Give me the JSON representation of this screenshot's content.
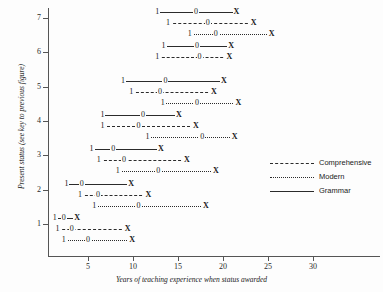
{
  "chart_data": {
    "type": "line",
    "title": "",
    "xlabel": "Years of teaching experience when status awarded",
    "ylabel": "Present status (see key to previous figure)",
    "xlim": [
      0,
      37
    ],
    "ylim": [
      0.4,
      7.6
    ],
    "xticks": [
      5,
      10,
      15,
      20,
      25,
      30
    ],
    "yticks": [
      1,
      2,
      3,
      4,
      5,
      6,
      7
    ],
    "grid": false,
    "legend_position": "right",
    "point_labels": [
      "1",
      "0",
      "X"
    ],
    "legend": [
      {
        "name": "Comprehensive",
        "style": "dashed"
      },
      {
        "name": "Modern",
        "style": "dotted"
      },
      {
        "name": "Grammar",
        "style": "solid"
      }
    ],
    "series": [
      {
        "status": 7,
        "rows": [
          {
            "school": "Grammar",
            "style": "grammar",
            "lower": 12.7,
            "median": 17.0,
            "upper": 21.4
          },
          {
            "school": "Comprehensive",
            "style": "comprehensive",
            "lower": 13.9,
            "median": 18.3,
            "upper": 23.3
          },
          {
            "school": "Modern",
            "style": "modern",
            "lower": 16.3,
            "median": 19.2,
            "upper": 25.3
          }
        ]
      },
      {
        "status": 6,
        "rows": [
          {
            "school": "Grammar",
            "style": "grammar",
            "lower": 13.4,
            "median": 17.1,
            "upper": 20.8
          },
          {
            "school": "Comprehensive",
            "style": "comprehensive",
            "lower": 12.7,
            "median": 17.4,
            "upper": 20.6
          }
        ]
      },
      {
        "status": 5,
        "rows": [
          {
            "school": "Grammar",
            "style": "grammar",
            "lower": 8.9,
            "median": 13.6,
            "upper": 20.0
          },
          {
            "school": "Comprehensive",
            "style": "comprehensive",
            "lower": 9.8,
            "median": 13.0,
            "upper": 18.9
          },
          {
            "school": "Modern",
            "style": "modern",
            "lower": 13.3,
            "median": 17.1,
            "upper": 21.6
          }
        ]
      },
      {
        "status": 4,
        "rows": [
          {
            "school": "Grammar",
            "style": "grammar",
            "lower": 6.6,
            "median": 11.1,
            "upper": 15.0
          },
          {
            "school": "Comprehensive",
            "style": "comprehensive",
            "lower": 6.6,
            "median": 10.6,
            "upper": 16.9
          },
          {
            "school": "Modern",
            "style": "modern",
            "lower": 11.6,
            "median": 17.7,
            "upper": 21.2
          }
        ]
      },
      {
        "status": 3,
        "rows": [
          {
            "school": "Grammar",
            "style": "grammar",
            "lower": 5.4,
            "median": 7.8,
            "upper": 13.0
          },
          {
            "school": "Comprehensive",
            "style": "comprehensive",
            "lower": 6.2,
            "median": 9.0,
            "upper": 15.9
          },
          {
            "school": "Modern",
            "style": "modern",
            "lower": 8.3,
            "median": 12.8,
            "upper": 19.1
          }
        ]
      },
      {
        "status": 2,
        "rows": [
          {
            "school": "Grammar",
            "style": "grammar",
            "lower": 2.6,
            "median": 4.3,
            "upper": 9.7
          },
          {
            "school": "Comprehensive",
            "style": "comprehensive",
            "lower": 4.1,
            "median": 6.1,
            "upper": 11.6
          },
          {
            "school": "Modern",
            "style": "modern",
            "lower": 5.7,
            "median": 10.6,
            "upper": 18.0
          }
        ]
      },
      {
        "status": 1,
        "rows": [
          {
            "school": "Grammar",
            "style": "grammar",
            "lower": 1.3,
            "median": 2.3,
            "upper": 3.7
          },
          {
            "school": "Comprehensive",
            "style": "comprehensive",
            "lower": 1.6,
            "median": 3.2,
            "upper": 9.3
          },
          {
            "school": "Modern",
            "style": "modern",
            "lower": 2.3,
            "median": 5.0,
            "upper": 9.8
          }
        ]
      }
    ]
  }
}
